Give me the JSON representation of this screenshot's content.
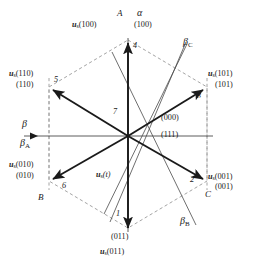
{
  "figure": {
    "type": "space-vector-hexagon",
    "title": "",
    "center_label": "7",
    "zero_vectors": [
      "(000)",
      "(111)"
    ],
    "reference_vector": "u (t)"
  },
  "axes": [
    {
      "name": "alpha-axis",
      "label": "α",
      "position": "top-right-of-A"
    },
    {
      "name": "beta-axis",
      "label": "β",
      "position": "left-above-arrow"
    },
    {
      "name": "beta-a-axis",
      "label": "β",
      "sub": "A",
      "position": "left-below-arrow"
    },
    {
      "name": "beta-b-axis",
      "label": "β",
      "sub": "B",
      "position": "bottom-right"
    },
    {
      "name": "beta-c-axis",
      "label": "β",
      "sub": "C",
      "position": "top-right"
    }
  ],
  "phase_axes": [
    {
      "name": "phase-a",
      "label": "A",
      "position": "top"
    },
    {
      "name": "phase-b",
      "label": "B",
      "position": "bottom-left"
    },
    {
      "name": "phase-c",
      "label": "C",
      "position": "bottom-right"
    }
  ],
  "vectors": [
    {
      "index": "4",
      "angle_deg": 90,
      "vector_label_u": "u",
      "vector_label_sub": "s",
      "vector_label_arg": "(100)",
      "state": "(100)",
      "phase_axis": "A"
    },
    {
      "index": "5",
      "angle_deg": 150,
      "vector_label_u": "u",
      "vector_label_sub": "s",
      "vector_label_arg": "(110)",
      "state": "(110)",
      "phase_axis": ""
    },
    {
      "index": "6",
      "angle_deg": 210,
      "vector_label_u": "u",
      "vector_label_sub": "s",
      "vector_label_arg": "(010)",
      "state": "(010)",
      "phase_axis": "B"
    },
    {
      "index": "1",
      "angle_deg": 270,
      "vector_label_u": "u",
      "vector_label_sub": "s",
      "vector_label_arg": "(011)",
      "state": "(011)",
      "phase_axis": ""
    },
    {
      "index": "2",
      "angle_deg": 330,
      "vector_label_u": "u",
      "vector_label_sub": "s",
      "vector_label_arg": "(001)",
      "state": "(001)",
      "phase_axis": "C"
    },
    {
      "index": "3",
      "angle_deg": 30,
      "vector_label_u": "u",
      "vector_label_sub": "s",
      "vector_label_arg": "(101)",
      "state": "(101)",
      "phase_axis": ""
    }
  ],
  "labels": {
    "top_phase": "A",
    "top_alpha": "α",
    "top_vector_u": "u",
    "top_vector_sub": "s",
    "top_vector_arg": "(100)",
    "top_state": "(100)",
    "top_index": "4",
    "upleft_vector_u": "u",
    "upleft_vector_sub": "s",
    "upleft_vector_arg": "(110)",
    "upleft_state": "(110)",
    "upleft_index": "5",
    "upright_vector_u": "u",
    "upright_vector_sub": "s",
    "upright_vector_arg": "(101)",
    "upright_state": "(101)",
    "upright_index": "3",
    "lowleft_vector_u": "u",
    "lowleft_vector_sub": "s",
    "lowleft_vector_arg": "(010)",
    "lowleft_state": "(010)",
    "lowleft_index": "6",
    "lowleft_phase": "B",
    "lowright_vector_u": "u",
    "lowright_vector_sub": "s",
    "lowright_vector_arg": "(001)",
    "lowright_state": "(001)",
    "lowright_index": "2",
    "lowright_phase": "C",
    "bottom_state": "(011)",
    "bottom_vector_u": "u",
    "bottom_vector_sub": "s",
    "bottom_vector_arg": "(011)",
    "bottom_index": "1",
    "center_index": "7",
    "zero_000": "(000)",
    "zero_111": "(111)",
    "ref_u": "u",
    "ref_sub": "s",
    "ref_arg": "(t)",
    "beta_main": "β",
    "beta_a": "β",
    "beta_a_sub": "A",
    "beta_b": "β",
    "beta_b_sub": "B",
    "beta_c": "β",
    "beta_c_sub": "C"
  },
  "colors": {
    "solid_line": "#1a1a1a",
    "dashed_line": "#9a9a9a",
    "thin_line": "#4a4a4a",
    "background": "#ffffff"
  }
}
